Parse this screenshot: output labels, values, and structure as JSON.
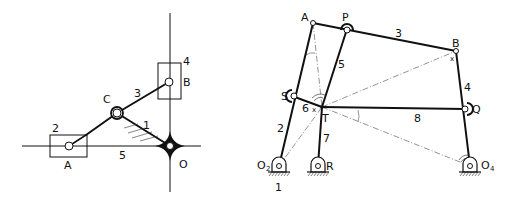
{
  "left_diagram": {
    "title": "Elliptic trammel mechanism",
    "labels": {
      "link1": "1",
      "link2": "2",
      "link3": "3",
      "link4": "4",
      "link5": "5",
      "pointA": "A",
      "pointB": "B",
      "pointC": "C",
      "pointO": "O"
    }
  },
  "right_diagram": {
    "title": "Eight-link mechanism",
    "labels": {
      "pointA": "A",
      "pointP": "P",
      "pointB": "B",
      "pointS": "S",
      "pointT": "T",
      "pointQ": "Q",
      "pointR": "R",
      "pivotO2": "O",
      "pivotO2_sub": "2",
      "pivotO4": "O",
      "pivotO4_sub": "4",
      "link1": "1",
      "link2": "2",
      "link3": "3",
      "link4": "4",
      "link5": "5",
      "link6": "6",
      "link7": "7",
      "link8": "8"
    }
  },
  "colors": {
    "line": "#111111",
    "construction": "#777777",
    "background": "#ffffff"
  }
}
